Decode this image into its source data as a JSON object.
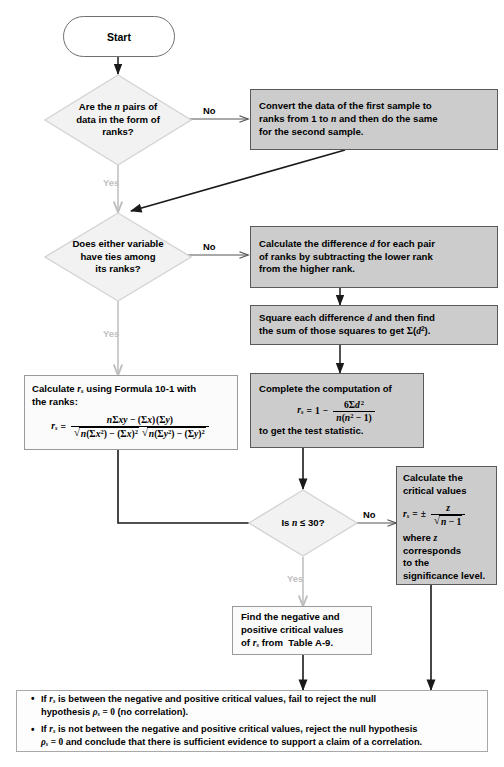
{
  "diagram": {
    "type": "flowchart",
    "colors": {
      "gray_box_fill": "#cccccc",
      "gray_box_border": "#5a5a5a",
      "white_box_fill": "#fbfbfb",
      "white_box_border": "#9a9a9a",
      "diamond_fill": "#f2f2f2",
      "diamond_border": "#d2d2d2",
      "connector": "#1a1a1a",
      "yes_label": "#c0c0c0"
    }
  },
  "nodes": {
    "start": {
      "label": "Start",
      "shape": "terminator"
    },
    "decision_ranks": {
      "shape": "decision",
      "line1": "Are the n pairs of",
      "line2": "data in the form of",
      "line3": "ranks?"
    },
    "convert_ranks": {
      "shape": "process",
      "fill": "gray",
      "line1": "Convert the data of the first sample to",
      "line2": "ranks from 1 to n and then do the same",
      "line3": "for the second sample."
    },
    "decision_ties": {
      "shape": "decision",
      "line1": "Does either variable",
      "line2": "have ties among",
      "line3": "its ranks?"
    },
    "calc_difference": {
      "shape": "process",
      "fill": "gray",
      "line1": "Calculate the difference d for each pair",
      "line2": "of ranks by subtracting the lower rank",
      "line3": "from the higher rank."
    },
    "square_difference": {
      "shape": "process",
      "fill": "gray",
      "line1": "Square each difference d and then find",
      "line2": "the sum of those squares to get ∑(d²)."
    },
    "formula_10_1": {
      "shape": "process",
      "fill": "white",
      "line1": "Calculate rₛ using  Formula 10-1 with",
      "line2": "the ranks:",
      "formula": {
        "lhs": "rₛ",
        "eq": "=",
        "numerator": "n∑xy − (∑x) (∑y)",
        "denominator": "√n(∑x²) − (∑x)² √n(∑y²) − (∑y)²"
      }
    },
    "complete_computation": {
      "shape": "process",
      "fill": "gray",
      "line1": "Complete the computation of",
      "formula": {
        "lhs": "rₛ",
        "eq": "=",
        "one": "1",
        "minus": "−",
        "numerator": "6∑d²",
        "denominator": "n(n² − 1)"
      },
      "line2": "to get the test statistic."
    },
    "decision_n30": {
      "shape": "decision",
      "label": "Is n ≤ 30?"
    },
    "critical_values_z": {
      "shape": "process",
      "fill": "gray",
      "line1": "Calculate the",
      "line2": "critical values",
      "formula": {
        "lhs": "rₛ",
        "eq": "=",
        "pm": "±",
        "numerator": "z",
        "denominator": "√n − 1"
      },
      "line3": "where z",
      "line4": "corresponds",
      "line5": "to the",
      "line6": "significance level."
    },
    "table_a9": {
      "shape": "process",
      "fill": "white",
      "line1": "Find the negative and",
      "line2": "positive  critical values",
      "line3": "of rₛ from  Table A-9."
    },
    "conclusion": {
      "shape": "process",
      "fill": "white",
      "bullet1_a": "If rₛ is between the negative and positive critical values, fail to reject the null",
      "bullet1_b": "hypothesis ρₛ = 0 (no correlation).",
      "bullet2_a": "If rₛ is not between the negative and positive critical values, reject the null hypothesis",
      "bullet2_b": "ρₛ = 0 and conclude that there is sufficient evidence to support a claim of a correlation."
    }
  },
  "edges": {
    "no_1": "No",
    "yes_1": "Yes",
    "no_2": "No",
    "yes_2": "Yes",
    "no_3": "No",
    "yes_3": "Yes"
  }
}
